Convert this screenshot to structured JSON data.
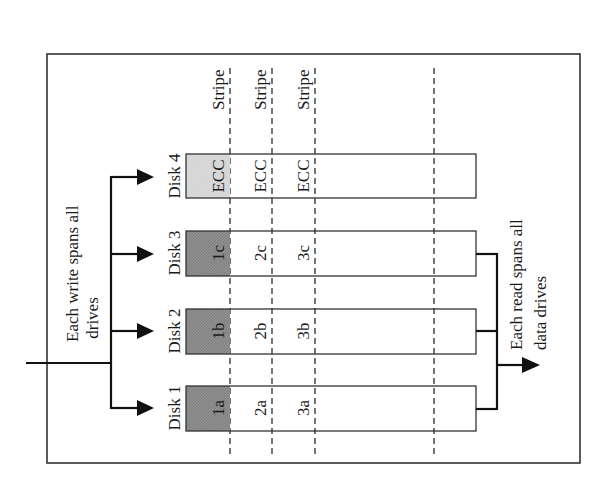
{
  "diagram": {
    "type": "RAID 3 striping with dedicated ECC parity disk",
    "orientation": "rotated 90 degrees counter-clockwise",
    "write_label": [
      "Each write spans all",
      "drives"
    ],
    "read_label": [
      "Each read spans all",
      "data drives"
    ],
    "stripe_label": "Stripe",
    "stripes": [
      "Stripe",
      "Stripe",
      "Stripe"
    ],
    "disks": [
      {
        "name": "Disk 1",
        "role": "data",
        "blocks": [
          "1a",
          "2a",
          "3a"
        ]
      },
      {
        "name": "Disk 2",
        "role": "data",
        "blocks": [
          "1b",
          "2b",
          "3b"
        ]
      },
      {
        "name": "Disk 3",
        "role": "data",
        "blocks": [
          "1c",
          "2c",
          "3c"
        ]
      },
      {
        "name": "Disk 4",
        "role": "parity",
        "blocks": [
          "ECC",
          "ECC",
          "ECC"
        ]
      }
    ],
    "colors": {
      "data_first_block_fill": "#8c8c8c",
      "parity_first_block_fill": "#d9d9d9",
      "line": "#1a1a1a",
      "border": "#333333",
      "background": "#ffffff"
    }
  }
}
